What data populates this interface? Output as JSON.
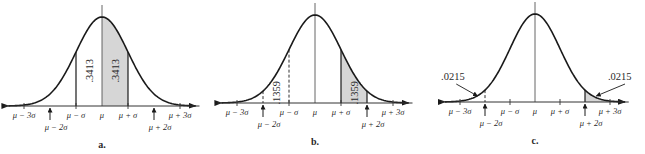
{
  "figure": {
    "colors": {
      "curve": "#1a1a1a",
      "axis": "#333333",
      "shade": "#d6d6d6",
      "text": "#2a2a2a"
    },
    "panels": [
      {
        "id": "a",
        "label": "a.",
        "mean_x": 102,
        "sigma_px": 26,
        "axis_y": 106,
        "peak_y": 17,
        "shade_from": 0,
        "shade_to": 1,
        "solid_verticals": [
          -1,
          0,
          1
        ],
        "dashed_verticals": [],
        "area_labels": [
          {
            "text": ".3413",
            "at": -0.5,
            "rotated": true
          },
          {
            "text": ".3413",
            "at": 0.5,
            "rotated": true
          }
        ],
        "tick_labels": {
          "m3": "μ − 3σ",
          "m2": "μ − 2σ",
          "m1": "μ − σ",
          "mu": "μ",
          "p1": "μ + σ",
          "p2": "μ + 2σ",
          "p3": "μ + 3σ"
        }
      },
      {
        "id": "b",
        "label": "b.",
        "mean_x": 315,
        "sigma_px": 26,
        "axis_y": 103,
        "peak_y": 15,
        "shade_from": 1,
        "shade_to": 2,
        "solid_verticals": [
          0,
          1,
          2
        ],
        "dashed_verticals": [
          -2,
          -1
        ],
        "area_labels": [
          {
            "text": ".1359",
            "at": -1.5,
            "rotated": true
          },
          {
            "text": ".1359",
            "at": 1.5,
            "rotated": true
          }
        ],
        "tick_labels": {
          "m3": "μ − 3σ",
          "m2": "μ − 2σ",
          "m1": "μ − σ",
          "mu": "μ",
          "p1": "μ + σ",
          "p2": "μ + 2σ",
          "p3": "μ + 3σ"
        }
      },
      {
        "id": "c",
        "label": "c.",
        "mean_x": 535,
        "sigma_px": 25,
        "axis_y": 102,
        "peak_y": 14,
        "shade_from": 2,
        "shade_to": 3,
        "solid_verticals": [
          0,
          2,
          3
        ],
        "dashed_verticals": [
          -2
        ],
        "area_labels": [
          {
            "text": ".0215",
            "side": "left"
          },
          {
            "text": ".0215",
            "side": "right"
          }
        ],
        "tick_labels": {
          "m3": "μ − 3σ",
          "m2": "μ − 2σ",
          "m1": "μ − σ",
          "mu": "μ",
          "p1": "μ + σ",
          "p2": "μ + 2σ",
          "p3": "μ + 3σ"
        }
      }
    ]
  }
}
